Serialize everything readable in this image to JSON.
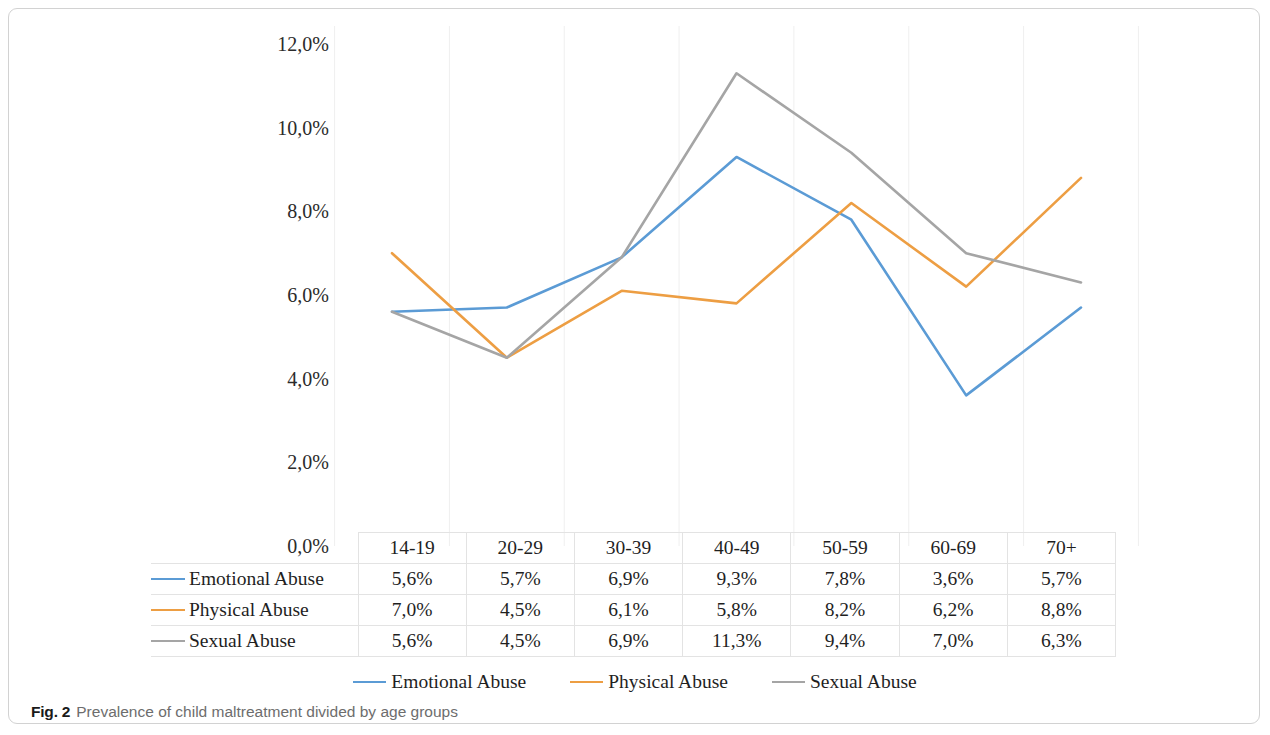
{
  "caption": {
    "label": "Fig. 2",
    "text": "Prevalence of child maltreatment divided by age groups"
  },
  "chart_data": {
    "type": "line",
    "title": "",
    "xlabel": "",
    "ylabel": "",
    "ylim": [
      0,
      12
    ],
    "y_ticks": [
      "0,0%",
      "2,0%",
      "4,0%",
      "6,0%",
      "8,0%",
      "10,0%",
      "12,0%"
    ],
    "y_tick_values": [
      0,
      2,
      4,
      6,
      8,
      10,
      12
    ],
    "grid": "vertical-only",
    "legend_position": "bottom",
    "categories": [
      "14-19",
      "20-29",
      "30-39",
      "40-49",
      "50-59",
      "60-69",
      "70+"
    ],
    "series": [
      {
        "name": "Emotional Abuse",
        "color": "#5B9BD5",
        "values": [
          5.6,
          5.7,
          6.9,
          9.3,
          7.8,
          3.6,
          5.7
        ],
        "labels": [
          "5,6%",
          "5,7%",
          "6,9%",
          "9,3%",
          "7,8%",
          "3,6%",
          "5,7%"
        ]
      },
      {
        "name": "Physical Abuse",
        "color": "#ED9E43",
        "values": [
          7.0,
          4.5,
          6.1,
          5.8,
          8.2,
          6.2,
          8.8
        ],
        "labels": [
          "7,0%",
          "4,5%",
          "6,1%",
          "5,8%",
          "8,2%",
          "6,2%",
          "8,8%"
        ]
      },
      {
        "name": "Sexual Abuse",
        "color": "#A5A5A5",
        "values": [
          5.6,
          4.5,
          6.9,
          11.3,
          9.4,
          7.0,
          6.3
        ],
        "labels": [
          "5,6%",
          "4,5%",
          "6,9%",
          "11,3%",
          "9,4%",
          "7,0%",
          "6,3%"
        ]
      }
    ]
  }
}
